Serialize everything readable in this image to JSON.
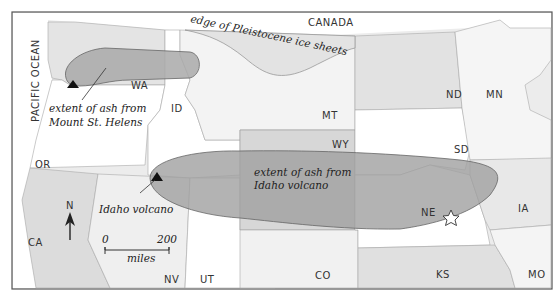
{
  "map": {
    "title": "",
    "labels": {
      "canada": "CANADA",
      "pacific_ocean": "PACIFIC OCEAN",
      "ice_edge": "edge of Pleistocene ice sheets",
      "mt_st_helens_ash_line1": "extent of ash from",
      "mt_st_helens_ash_line2": "Mount St. Helens",
      "idaho_ash_line1": "extent of ash from",
      "idaho_ash_line2": "Idaho volcano",
      "idaho_volcano": "Idaho volcano"
    },
    "states": {
      "WA": "WA",
      "ID": "ID",
      "OR": "OR",
      "CA": "CA",
      "NV": "NV",
      "UT": "UT",
      "MT": "MT",
      "WY": "WY",
      "CO": "CO",
      "ND": "ND",
      "SD": "SD",
      "NE": "NE",
      "KS": "KS",
      "MN": "MN",
      "IA": "IA",
      "MO": "MO"
    },
    "compass": {
      "label": "N"
    },
    "scale_bar": {
      "min": "0",
      "max": "200",
      "unit": "miles"
    },
    "markers": [
      {
        "type": "volcano",
        "name": "Mount St. Helens",
        "symbol": "triangle"
      },
      {
        "type": "volcano",
        "name": "Idaho volcano",
        "symbol": "triangle"
      },
      {
        "type": "site",
        "name": "NE site",
        "symbol": "star"
      }
    ],
    "colors": {
      "ash": "#a8a8a8",
      "ice": "#e6e6e6",
      "land_light": "#f2f2f2",
      "land_white": "#ffffff",
      "border": "#555555"
    }
  }
}
